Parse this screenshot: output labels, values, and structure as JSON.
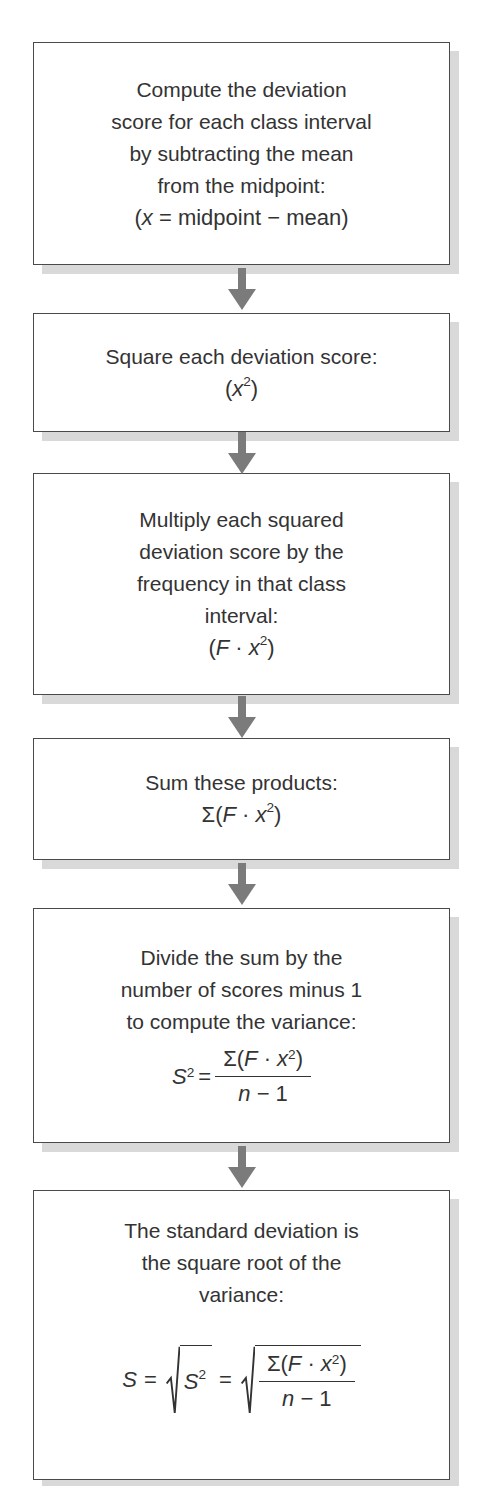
{
  "colors": {
    "background": "#ffffff",
    "box_border": "#4a4a4a",
    "box_shadow": "#d9d9d9",
    "arrow": "#7b7b7b",
    "text": "#333333"
  },
  "flowchart": {
    "steps": [
      {
        "lines": [
          "Compute the deviation",
          "score for each class interval",
          "by subtracting the mean",
          "from the midpoint:"
        ],
        "formula": {
          "open": "(",
          "var": "x",
          "rest": " = midpoint − mean)"
        }
      },
      {
        "lines": [
          "Square each deviation score:"
        ],
        "formula": {
          "open": "(",
          "var": "x",
          "sup": "2",
          "close": ")"
        }
      },
      {
        "lines": [
          "Multiply each squared",
          "deviation score by the",
          "frequency in that class",
          "interval:"
        ],
        "formula": {
          "open": "(",
          "F": "F",
          "dot": " · ",
          "var": "x",
          "sup": "2",
          "close": ")"
        }
      },
      {
        "lines": [
          "Sum these products:"
        ],
        "formula": {
          "sigma": "Σ(",
          "F": "F",
          "dot": " · ",
          "var": "x",
          "sup": "2",
          "close": ")"
        }
      },
      {
        "lines": [
          "Divide the sum by the",
          "number of scores minus 1",
          "to compute the variance:"
        ],
        "formula": {
          "lhs": "S",
          "lhs_sup": "2",
          "eq": "=",
          "num": {
            "sigma": "Σ(",
            "F": "F",
            "dot": " · ",
            "var": "x",
            "sup": "2",
            "close": ")"
          },
          "den": {
            "n": "n",
            "rest": " − 1"
          }
        }
      },
      {
        "lines": [
          "The standard deviation is",
          "the square root of the",
          "variance:"
        ],
        "formula": {
          "S": "S",
          "eq1": "=",
          "eq2": "=",
          "inner": {
            "S": "S",
            "sup": "2"
          },
          "num": {
            "sigma": "Σ(",
            "F": "F",
            "dot": " · ",
            "var": "x",
            "sup": "2",
            "close": ")"
          },
          "den": {
            "n": "n",
            "rest": " − 1"
          }
        }
      }
    ]
  }
}
